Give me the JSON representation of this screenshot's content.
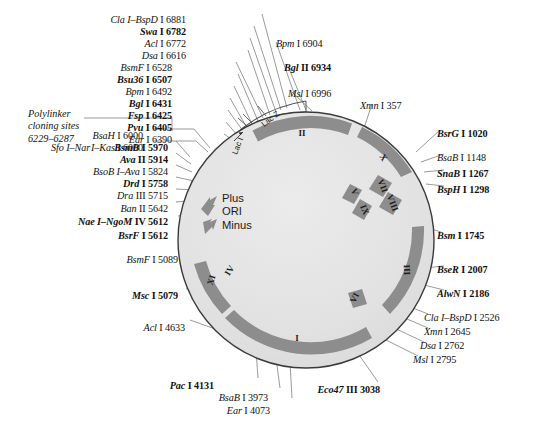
{
  "figure": {
    "type": "plasmid-map",
    "center": {
      "x": 306,
      "y": 240
    },
    "outer_radius": 128
  },
  "polylinker": {
    "line1": "Polylinker",
    "line2": "cloning sites",
    "line3": "6229–6287"
  },
  "ori": {
    "plus": "Plus",
    "label": "ORI",
    "minus": "Minus"
  },
  "ring_genes": [
    {
      "name": "lac Z",
      "text": "Lac Z"
    },
    {
      "name": "lac I",
      "text": "Lac I"
    }
  ],
  "segments": [
    {
      "label": "I"
    },
    {
      "label": "II"
    },
    {
      "label": "III"
    },
    {
      "label": "IV"
    },
    {
      "label": "V"
    },
    {
      "label": "VI"
    },
    {
      "label": "VII"
    },
    {
      "label": "VIII"
    },
    {
      "label": "IX"
    },
    {
      "label": "X"
    },
    {
      "label": "XI"
    }
  ],
  "sites": {
    "top_left": [
      {
        "enzyme": "Cla I–BspD I",
        "position": "6881",
        "bold": false,
        "x": 186,
        "y": 14
      },
      {
        "enzyme": "Swa I",
        "position": "6782",
        "bold": true,
        "x": 186,
        "y": 26
      },
      {
        "enzyme": "Acl I",
        "position": "6772",
        "bold": false,
        "x": 186,
        "y": 38
      },
      {
        "enzyme": "Dsa I",
        "position": "6616",
        "bold": false,
        "x": 186,
        "y": 50
      },
      {
        "enzyme": "BsmF I",
        "position": "6528",
        "bold": false,
        "x": 172,
        "y": 62
      },
      {
        "enzyme": "Bsu36 I",
        "position": "6507",
        "bold": true,
        "x": 172,
        "y": 74
      },
      {
        "enzyme": "Bpm I",
        "position": "6492",
        "bold": false,
        "x": 172,
        "y": 86
      },
      {
        "enzyme": "Bgl I",
        "position": "6431",
        "bold": true,
        "x": 172,
        "y": 98
      },
      {
        "enzyme": "Fsp I",
        "position": "6425",
        "bold": true,
        "x": 172,
        "y": 110
      },
      {
        "enzyme": "Pvu I",
        "position": "6405",
        "bold": true,
        "x": 172,
        "y": 122
      },
      {
        "enzyme": "Ear I",
        "position": "6390",
        "bold": false,
        "x": 172,
        "y": 134
      }
    ],
    "top_right": [
      {
        "enzyme": "Bpm I",
        "position": "6904",
        "bold": false,
        "x": 276,
        "y": 38
      },
      {
        "enzyme": "Bgl II",
        "position": "6934",
        "bold": true,
        "x": 284,
        "y": 62
      },
      {
        "enzyme": "Msl I",
        "position": "6996",
        "bold": false,
        "x": 288,
        "y": 88
      },
      {
        "enzyme": "Xmn I",
        "position": "357",
        "bold": false,
        "x": 360,
        "y": 100
      }
    ],
    "right": [
      {
        "enzyme": "BsrG I",
        "position": "1020",
        "bold": true,
        "x": 437,
        "y": 128
      },
      {
        "enzyme": "BsaB I",
        "position": "1148",
        "bold": false,
        "x": 437,
        "y": 152
      },
      {
        "enzyme": "SnaB I",
        "position": "1267",
        "bold": true,
        "x": 437,
        "y": 168
      },
      {
        "enzyme": "BspH I",
        "position": "1298",
        "bold": true,
        "x": 437,
        "y": 184
      },
      {
        "enzyme": "Bsm I",
        "position": "1745",
        "bold": true,
        "x": 437,
        "y": 230
      },
      {
        "enzyme": "BseR I",
        "position": "2007",
        "bold": true,
        "x": 437,
        "y": 264
      },
      {
        "enzyme": "AlwN I",
        "position": "2186",
        "bold": true,
        "x": 437,
        "y": 288
      },
      {
        "enzyme": "Cla I–BspD I",
        "position": "2526",
        "bold": false,
        "x": 424,
        "y": 312
      },
      {
        "enzyme": "Xmn I",
        "position": "2645",
        "bold": false,
        "x": 424,
        "y": 326
      },
      {
        "enzyme": "Dsa I",
        "position": "2762",
        "bold": false,
        "x": 420,
        "y": 340
      },
      {
        "enzyme": "Msl I",
        "position": "2795",
        "bold": false,
        "x": 413,
        "y": 354
      }
    ],
    "bottom": [
      {
        "enzyme": "Eco47 III",
        "position": "3038",
        "bold": true,
        "x": 380,
        "y": 384
      },
      {
        "enzyme": "Ear I",
        "position": "4073",
        "bold": false,
        "x": 270,
        "y": 405
      },
      {
        "enzyme": "BsaB I",
        "position": "3973",
        "bold": false,
        "x": 268,
        "y": 392
      },
      {
        "enzyme": "Pac I",
        "position": "4131",
        "bold": true,
        "x": 214,
        "y": 380
      }
    ],
    "left": [
      {
        "enzyme": "Acl I",
        "position": "4633",
        "bold": false,
        "x": 185,
        "y": 322
      },
      {
        "enzyme": "Msc I",
        "position": "5079",
        "bold": true,
        "x": 178,
        "y": 290
      },
      {
        "enzyme": "BsmF I",
        "position": "5089",
        "bold": false,
        "x": 178,
        "y": 254
      },
      {
        "enzyme": "BsrF I",
        "position": "5612",
        "bold": true,
        "x": 168,
        "y": 230
      },
      {
        "enzyme": "Nae I–NgoM IV",
        "position": "5612",
        "bold": true,
        "x": 168,
        "y": 216
      },
      {
        "enzyme": "Ban II",
        "position": "5642",
        "bold": false,
        "x": 168,
        "y": 203
      },
      {
        "enzyme": "Dra III",
        "position": "5715",
        "bold": false,
        "x": 168,
        "y": 190
      },
      {
        "enzyme": "Drd I",
        "position": "5758",
        "bold": true,
        "x": 168,
        "y": 178
      },
      {
        "enzyme": "BsoB I–Ava I",
        "position": "5824",
        "bold": false,
        "x": 168,
        "y": 166
      },
      {
        "enzyme": "Ava II",
        "position": "5914",
        "bold": true,
        "x": 168,
        "y": 154
      },
      {
        "enzyme": "BsmB I",
        "position": "5970",
        "bold": true,
        "x": 168,
        "y": 142
      },
      {
        "enzyme": "BsaH I",
        "position": "6000",
        "bold": false,
        "x": 143,
        "y": 130
      },
      {
        "enzyme": "I–Kas I",
        "position": "6000",
        "bold": false,
        "x": 143,
        "y": 142
      },
      {
        "enzyme": "Sfo I–Nar",
        "position": "",
        "bold": false,
        "x": 90,
        "y": 142
      }
    ]
  }
}
